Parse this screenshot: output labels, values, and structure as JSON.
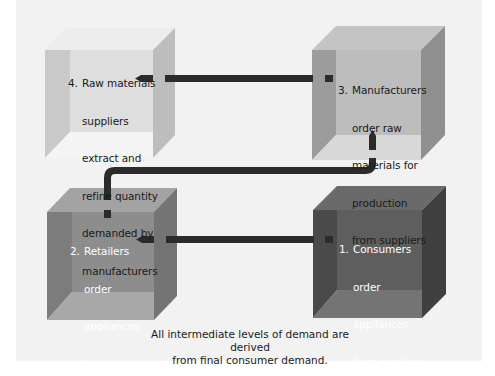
{
  "diagram": {
    "type": "flow",
    "title": "",
    "boxes": [
      {
        "id": 1,
        "number": "1.",
        "lines": [
          "Consumers",
          "order",
          "appliances",
          "from retailers"
        ],
        "shade": "dark"
      },
      {
        "id": 2,
        "number": "2.",
        "lines": [
          "Retailers",
          "order",
          "appliances",
          "from",
          "manufacturers"
        ],
        "shade": "medium"
      },
      {
        "id": 3,
        "number": "3.",
        "lines": [
          "Manufacturers",
          "order raw",
          "materials for",
          "production",
          "from suppliers"
        ],
        "shade": "light"
      },
      {
        "id": 4,
        "number": "4.",
        "lines": [
          "Raw materials",
          "suppliers",
          "extract and",
          "refine quantity",
          "demanded by",
          "manufacturers"
        ],
        "shade": "lightest"
      }
    ],
    "arrows": [
      {
        "from": 1,
        "to": 2,
        "direction": "left"
      },
      {
        "from": 2,
        "to": 3,
        "direction": "up"
      },
      {
        "from": 3,
        "to": 4,
        "direction": "left"
      }
    ],
    "caption_lines": [
      "All intermediate levels of demand are derived",
      "from final consumer demand."
    ]
  },
  "colors": {
    "background_band": "#f2f2f2",
    "arrow": "#2b2b2b",
    "box4": {
      "top": "#ececec",
      "wall": "#c9c9c9",
      "back": "#dedede",
      "floor": "#f4f4f4",
      "side": "#bdbdbd",
      "text": "#1a1a1a"
    },
    "box3": {
      "top": "#c4c4c4",
      "wall": "#9c9c9c",
      "back": "#bdbdbd",
      "floor": "#d8d8d8",
      "side": "#8f8f8f",
      "text": "#1a1a1a"
    },
    "box2": {
      "top": "#a3a3a3",
      "wall": "#7c7c7c",
      "back": "#8d8d8d",
      "floor": "#a8a8a8",
      "side": "#747474",
      "text": "#ffffff"
    },
    "box1": {
      "top": "#6a6a6a",
      "wall": "#4a4a4a",
      "back": "#5e5e5e",
      "floor": "#747474",
      "side": "#404040",
      "text": "#ffffff"
    }
  }
}
